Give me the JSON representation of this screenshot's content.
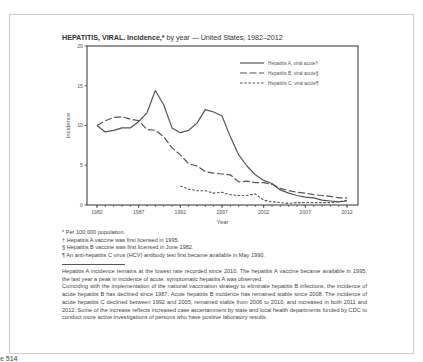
{
  "figure": {
    "title_main": "HEPATITIS, VIRAL. Incidence,*",
    "title_rest": " by year — United States, 1982–2012"
  },
  "legend": [
    {
      "label": "Hepatitis A, viral acute†",
      "style": "solid"
    },
    {
      "label": "Hepatitis B, viral acute§",
      "style": "long-dash"
    },
    {
      "label": "Hepatitis C, viral acute¶",
      "style": "short-dash"
    }
  ],
  "footnotes": [
    "* Per 100,000 population.",
    "† Hepatitis A vaccine was first licensed in 1995.",
    "§ Hepatitis B vaccine was first licensed in June 1982.",
    "¶ An anti-hepatitis C virus (HCV) antibody test first became available in May 1990."
  ],
  "summary": [
    "Hepatitis A incidence remains at the lowest rate recorded since 2010. The hepatitis A vaccine became available in 1995, the last year a peak in incidence of acute, symptomatic hepatitis A was observed.",
    "Coinciding with the implementation of the national vaccination strategy to eliminate hepatitis B infections, the incidence of acute hepatitis B has declined since 1987.  Acute hepatitis B incidence has remained stable since 2008. The incidence of acute hepatitis C declined between 1992 and 2005, remained stable from 2006 to 2010, and increased in both 2011 and 2012.  Some of the increase reflects increased case ascertainment by state and local health departments funded by CDC to conduct more active investigations of persons who have positive laboratory results."
  ],
  "page_fragment": "e 514",
  "colors": {
    "line": "#555555",
    "frame": "#cfcfcf",
    "axis": "#444444"
  },
  "chart_data": {
    "type": "line",
    "title": "HEPATITIS, VIRAL. Incidence,* by year — United States, 1982–2012",
    "xlabel": "Year",
    "ylabel": "Incidence",
    "xlim": [
      1982,
      2012
    ],
    "ylim": [
      0,
      20
    ],
    "xticks": [
      1982,
      1987,
      1992,
      1997,
      2002,
      2007,
      2012
    ],
    "yticks": [
      0,
      5,
      10,
      15,
      20
    ],
    "grid": false,
    "legend_position": "upper right",
    "series": [
      {
        "name": "Hepatitis A, viral acute†",
        "style": "solid",
        "x": [
          1982,
          1983,
          1984,
          1985,
          1986,
          1987,
          1988,
          1989,
          1990,
          1991,
          1992,
          1993,
          1994,
          1995,
          1996,
          1997,
          1998,
          1999,
          2000,
          2001,
          2002,
          2003,
          2004,
          2005,
          2006,
          2007,
          2008,
          2009,
          2010,
          2011,
          2012
        ],
        "values": [
          10.0,
          9.2,
          9.4,
          9.7,
          9.7,
          10.5,
          11.6,
          14.4,
          12.6,
          9.7,
          9.1,
          9.4,
          10.3,
          12.0,
          11.7,
          11.2,
          8.6,
          6.3,
          4.9,
          3.8,
          3.1,
          2.7,
          1.9,
          1.5,
          1.2,
          1.0,
          0.9,
          0.6,
          0.5,
          0.4,
          0.5
        ]
      },
      {
        "name": "Hepatitis B, viral acute§",
        "style": "long-dash",
        "x": [
          1982,
          1983,
          1984,
          1985,
          1986,
          1987,
          1988,
          1989,
          1990,
          1991,
          1992,
          1993,
          1994,
          1995,
          1996,
          1997,
          1998,
          1999,
          2000,
          2001,
          2002,
          2003,
          2004,
          2005,
          2006,
          2007,
          2008,
          2009,
          2010,
          2011,
          2012
        ],
        "values": [
          10.0,
          10.6,
          11.0,
          11.1,
          10.8,
          10.6,
          9.5,
          9.4,
          8.6,
          7.2,
          6.3,
          5.2,
          4.9,
          4.2,
          4.0,
          3.9,
          3.8,
          2.9,
          3.0,
          2.8,
          2.8,
          2.6,
          2.1,
          1.8,
          1.6,
          1.5,
          1.3,
          1.2,
          1.1,
          0.9,
          0.9
        ]
      },
      {
        "name": "Hepatitis C, viral acute¶",
        "style": "short-dash",
        "x": [
          1992,
          1993,
          1994,
          1995,
          1996,
          1997,
          1998,
          1999,
          2000,
          2001,
          2002,
          2003,
          2004,
          2005,
          2006,
          2007,
          2008,
          2009,
          2010,
          2011,
          2012
        ],
        "values": [
          2.4,
          2.0,
          1.8,
          1.8,
          1.5,
          1.6,
          1.3,
          1.2,
          1.2,
          1.4,
          0.6,
          0.4,
          0.3,
          0.2,
          0.3,
          0.3,
          0.3,
          0.3,
          0.3,
          0.4,
          0.6
        ]
      }
    ]
  }
}
